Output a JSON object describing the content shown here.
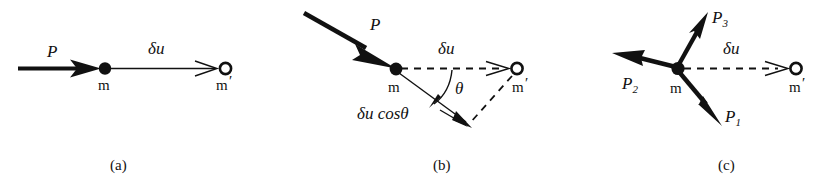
{
  "figure": {
    "background_color": "#ffffff",
    "ink_color": "#111111",
    "panels": [
      {
        "id": "a",
        "caption": "(a)",
        "labels": {
          "force": "P",
          "mass": "m",
          "mass_displaced": "m",
          "mass_displaced_prime": "′",
          "displacement": "δu"
        },
        "description": "Single force P acting horizontally on mass m, virtual displacement delta-u to m-prime"
      },
      {
        "id": "b",
        "caption": "(b)",
        "labels": {
          "force": "P",
          "mass": "m",
          "mass_displaced": "m",
          "mass_displaced_prime": "′",
          "displacement": "δu",
          "angle": "θ",
          "projection": "δu cosθ"
        },
        "description": "Force P at angle theta to virtual displacement delta-u; component delta-u cos theta along P"
      },
      {
        "id": "c",
        "caption": "(c)",
        "labels": {
          "force_1": "P",
          "force_1_sub": "1",
          "force_2": "P",
          "force_2_sub": "2",
          "force_3": "P",
          "force_3_sub": "3",
          "mass": "m",
          "mass_displaced": "m",
          "mass_displaced_prime": "′",
          "displacement": "δu"
        },
        "description": "Three forces P1, P2, P3 acting on mass m with virtual displacement delta-u to m-prime"
      }
    ]
  }
}
